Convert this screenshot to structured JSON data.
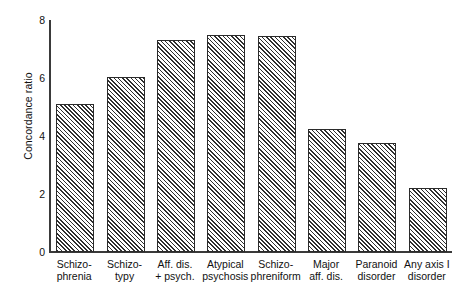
{
  "chart_data": {
    "type": "bar",
    "title": "",
    "xlabel": "",
    "ylabel": "Concordance ratio",
    "ylim": [
      0,
      8
    ],
    "yticks": [
      0,
      2,
      4,
      6,
      8
    ],
    "ytick_labels": [
      "0",
      "2",
      "4",
      "6",
      "8"
    ],
    "grid": false,
    "legend": null,
    "bar_style": {
      "fill": "diagonal-hatch",
      "hatch_angle_deg": 45,
      "edge_color": "#2b2b2b",
      "face_color": "#ffffff",
      "hatch_color": "#2f2f2f"
    },
    "categories": [
      "Schizophrenia",
      "Schizotypy",
      "Aff. dis. + psych.",
      "Atypical psychosis",
      "Schizophreniform",
      "Major aff. dis.",
      "Paranoid disorder",
      "Any axis I disorder"
    ],
    "category_label_lines": [
      [
        "Schizo-",
        "phrenia"
      ],
      [
        "Schizo-",
        "typy"
      ],
      [
        "Aff. dis.",
        "+ psych."
      ],
      [
        "Atypical",
        "psychosis"
      ],
      [
        "Schizo-",
        "phreniform"
      ],
      [
        "Major",
        "aff. dis."
      ],
      [
        "Paranoid",
        "disorder"
      ],
      [
        "Any axis I",
        "disorder"
      ]
    ],
    "values": [
      5.1,
      6.05,
      7.3,
      7.5,
      7.45,
      4.25,
      3.75,
      2.2
    ]
  }
}
